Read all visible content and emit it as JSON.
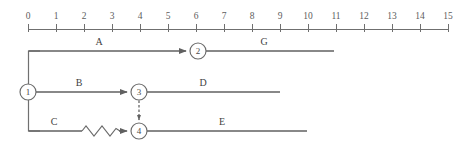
{
  "diagram": {
    "type": "activity-on-arrow-network",
    "timescale": {
      "min": 0,
      "max": 15,
      "unit_step": 1,
      "tick_labels": [
        "0",
        "1",
        "2",
        "3",
        "4",
        "5",
        "6",
        "7",
        "8",
        "9",
        "10",
        "11",
        "12",
        "13",
        "14",
        "15"
      ],
      "x_origin_px": 28,
      "px_per_unit": 28,
      "baseline_y_px": 29,
      "axis_color": "#6f6f6f"
    },
    "nodes": [
      {
        "id": "1",
        "label": "1",
        "x_px": 28,
        "y_px": 92,
        "r_px": 8,
        "time": 0
      },
      {
        "id": "2",
        "label": "2",
        "x_px": 198,
        "y_px": 51,
        "r_px": 8,
        "time": 6.07
      },
      {
        "id": "3",
        "label": "3",
        "x_px": 139,
        "y_px": 92,
        "r_px": 8,
        "time": 3.96
      },
      {
        "id": "4",
        "label": "4",
        "x_px": 139,
        "y_px": 131,
        "r_px": 8,
        "time": 3.96
      }
    ],
    "activities": [
      {
        "id": "A",
        "label": "A",
        "from": "1",
        "to": "2",
        "label_x_px": 99,
        "label_y_px": 45,
        "start_time": 0,
        "end_time": 6.07,
        "duration": 6.07,
        "row_y_px": 51,
        "has_float": false
      },
      {
        "id": "G",
        "label": "G",
        "from": "2",
        "to": "end",
        "label_x_px": 264,
        "label_y_px": 45,
        "start_time": 6.07,
        "end_time": 10.93,
        "duration": 4.86,
        "row_y_px": 51,
        "has_float": false
      },
      {
        "id": "B",
        "label": "B",
        "from": "1",
        "to": "3",
        "label_x_px": 79,
        "label_y_px": 86,
        "start_time": 0,
        "end_time": 3.96,
        "duration": 3.96,
        "row_y_px": 92,
        "has_float": false
      },
      {
        "id": "D",
        "label": "D",
        "from": "3",
        "to": "end",
        "label_x_px": 203,
        "label_y_px": 86,
        "start_time": 3.96,
        "end_time": 9.0,
        "duration": 5.04,
        "row_y_px": 92,
        "has_float": false
      },
      {
        "id": "C",
        "label": "C",
        "from": "1",
        "to": "4",
        "label_x_px": 54,
        "label_y_px": 125,
        "start_time": 0,
        "end_time": 1.93,
        "duration": 1.93,
        "row_y_px": 131,
        "has_float": true,
        "float_start_px": 82,
        "float_end_px": 122
      },
      {
        "id": "E",
        "label": "E",
        "from": "4",
        "to": "end",
        "label_x_px": 222,
        "label_y_px": 125,
        "start_time": 3.96,
        "end_time": 9.96,
        "duration": 6.0,
        "row_y_px": 131,
        "has_float": false
      }
    ],
    "dummy_activities": [
      {
        "from": "3",
        "to": "4",
        "x_px": 139,
        "y1_px": 100,
        "y2_px": 123,
        "style": "dashed"
      }
    ],
    "line_ends": {
      "G_end_px": 334,
      "D_end_px": 280,
      "E_end_px": 307
    },
    "colors": {
      "background": "#ffffff",
      "axis": "#6f6f6f",
      "edge": "#606060",
      "node_stroke": "#6b6b6b",
      "node_fill": "#ffffff",
      "text": "#3f3f3f"
    }
  }
}
